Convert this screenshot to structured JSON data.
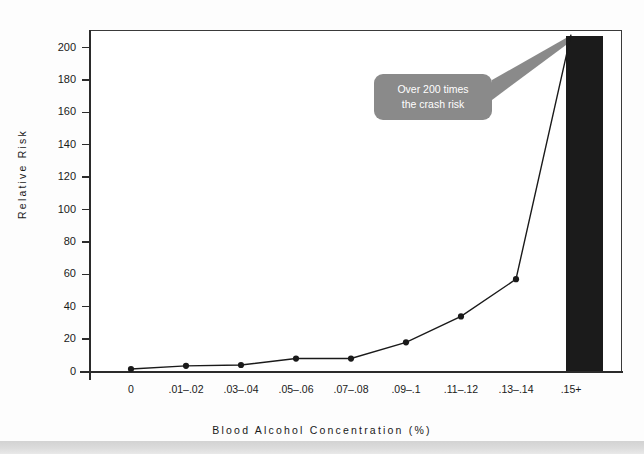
{
  "chart_data": {
    "type": "line",
    "title": "",
    "subtitle": "",
    "xlabel": "B l o o d   A l c o h o l   C o n c e n t r a t i o n   ( % )",
    "xlabel_text": "Blood Alcohol Concentration (%)",
    "ylabel_text": "Relative Risk",
    "categories": [
      "0",
      ".01–.02",
      ".03–.04",
      ".05–.06",
      ".07–.08",
      ".09–.1",
      ".11–.12",
      ".13–.14",
      ".15+"
    ],
    "values": [
      1.5,
      3.5,
      4,
      8,
      8,
      18,
      34,
      57,
      208
    ],
    "ylim": [
      0,
      210
    ],
    "ytick_labels": [
      "0",
      "20",
      "40",
      "60",
      "80",
      "100",
      "120",
      "140",
      "160",
      "180",
      "200"
    ],
    "ytick_values": [
      0,
      20,
      40,
      60,
      80,
      100,
      120,
      140,
      160,
      180,
      200
    ],
    "grid": false,
    "legend": "none",
    "marker": "filled-circle",
    "line_color": "#1a1a1a",
    "bar_color": "#1b1b1b",
    "bar_category": ".15+",
    "bar_value": 208,
    "annotations": [
      {
        "name": "crash-risk-callout",
        "line1": "Over 200 times",
        "line2": "the crash risk",
        "background": "#8a8a8a",
        "text_color": "#ffffff",
        "points_to": ".15+"
      }
    ]
  },
  "axes": {
    "y_title": "Relative Risk",
    "x_title": "Blood Alcohol Concentration (%)"
  },
  "colors": {
    "page_background": "#fdfdfd",
    "plot_background": "#ffffff",
    "axis": "#2b2b2b",
    "footer_band": "#d9d9d9"
  }
}
